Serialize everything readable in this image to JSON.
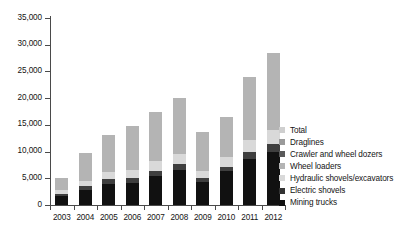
{
  "chart_data": {
    "type": "bar",
    "title": "",
    "subtitle": "",
    "xlabel": "",
    "ylabel": "",
    "stacked": true,
    "grid": false,
    "legend_position": "right",
    "categories": [
      "2003",
      "2004",
      "2005",
      "2006",
      "2007",
      "2008",
      "2009",
      "2010",
      "2011",
      "2012"
    ],
    "ylim": [
      0,
      35000
    ],
    "ytick_values": [
      0,
      5000,
      10000,
      15000,
      20000,
      25000,
      30000,
      35000
    ],
    "ytick_labels": [
      "0",
      "5,000",
      "10,000",
      "15,000",
      "20,000",
      "25,000",
      "30,000",
      "35,000"
    ],
    "series": [
      {
        "name": "Mining trucks",
        "color": "#111111",
        "values": [
          1600,
          2900,
          4000,
          4200,
          5400,
          6500,
          4400,
          6300,
          8600,
          9900
        ]
      },
      {
        "name": "Electric shovels",
        "color": "#3f3f3f",
        "values": [
          500,
          700,
          800,
          900,
          1000,
          1100,
          700,
          900,
          1300,
          1500
        ]
      },
      {
        "name": "Hydraulic shovels/excavators",
        "color": "#d9d9d9",
        "values": [
          700,
          900,
          1300,
          1400,
          1800,
          1900,
          1300,
          1700,
          2200,
          2600
        ]
      },
      {
        "name": "Wheel loaders",
        "color": "#b4b4b4",
        "values": [
          2200,
          5300,
          7100,
          8300,
          9200,
          10500,
          7200,
          7600,
          11900,
          14500
        ]
      },
      {
        "name": "Crawler and wheel dozers",
        "color": "#5a5a5a",
        "values": [
          0,
          0,
          0,
          0,
          0,
          0,
          0,
          0,
          0,
          0
        ]
      },
      {
        "name": "Draglines",
        "color": "#9a9a9a",
        "values": [
          0,
          0,
          0,
          0,
          0,
          0,
          0,
          0,
          0,
          0
        ]
      },
      {
        "name": "Total",
        "color": "#cfcfcf",
        "values": [
          5000,
          9800,
          13200,
          14800,
          17400,
          20000,
          13600,
          16500,
          24000,
          28500
        ]
      }
    ],
    "legend_entries": [
      {
        "label": "Total",
        "color": "#cfcfcf"
      },
      {
        "label": "Draglines",
        "color": "#9a9a9a"
      },
      {
        "label": "Crawler and wheel dozers",
        "color": "#5a5a5a"
      },
      {
        "label": "Wheel loaders",
        "color": "#b4b4b4"
      },
      {
        "label": "Hydraulic shovels/excavators",
        "color": "#d9d9d9"
      },
      {
        "label": "Electric shovels",
        "color": "#333333"
      },
      {
        "label": "Mining trucks",
        "color": "#111111"
      }
    ],
    "stack_order_bottom_to_top": [
      "Mining trucks",
      "Electric shovels",
      "Hydraulic shovels/excavators",
      "Wheel loaders"
    ],
    "bar_totals": [
      5000,
      9800,
      13200,
      14800,
      17400,
      20000,
      13600,
      16500,
      24000,
      28500
    ]
  }
}
